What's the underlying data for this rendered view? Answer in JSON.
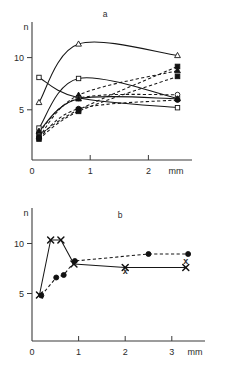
{
  "figure": {
    "background": "#ffffff",
    "ink_color": "#161616"
  },
  "chart_data": [
    {
      "panel_id": "a",
      "panel_label": "a",
      "type": "line",
      "title": "",
      "xlabel": "mm",
      "ylabel": "n",
      "xlim": [
        0,
        2.75
      ],
      "ylim": [
        0,
        12.2
      ],
      "xticks": [
        0,
        1,
        2
      ],
      "xtick_labels": [
        "0",
        "1",
        "2"
      ],
      "yticks": [
        5,
        10
      ],
      "ytick_labels": [
        "5",
        "10"
      ],
      "grid": false,
      "legend": "none",
      "series": [
        {
          "name": "open-triangle-up-rising",
          "marker": "triangle-up-open",
          "line": "solid",
          "x": [
            0.12,
            0.8,
            2.5
          ],
          "y": [
            5.7,
            11.3,
            10.2
          ]
        },
        {
          "name": "open-square-declining",
          "marker": "square-open",
          "line": "solid",
          "x": [
            0.12,
            0.8,
            2.5
          ],
          "y": [
            8.1,
            6.15,
            5.2
          ]
        },
        {
          "name": "open-square-rising",
          "marker": "square-open",
          "line": "solid",
          "x": [
            0.12,
            0.8,
            2.5
          ],
          "y": [
            3.25,
            8.0,
            6.1
          ]
        },
        {
          "name": "filled-square-dashed-upper",
          "marker": "square-filled",
          "line": "dashed",
          "x": [
            0.12,
            0.8,
            2.5
          ],
          "y": [
            2.55,
            5.0,
            9.15
          ]
        },
        {
          "name": "filled-triangle-dashed",
          "marker": "triangle-up-filled",
          "line": "dashed",
          "x": [
            0.12,
            0.8,
            2.5
          ],
          "y": [
            2.4,
            6.4,
            8.75
          ]
        },
        {
          "name": "filled-square-dashed-lower",
          "marker": "square-filled",
          "line": "dashed",
          "x": [
            0.12,
            0.8,
            2.5
          ],
          "y": [
            2.2,
            4.85,
            8.2
          ]
        },
        {
          "name": "open-circle-dashed",
          "marker": "circle-open",
          "line": "dashed",
          "x": [
            0.12,
            0.8,
            2.5
          ],
          "y": [
            2.85,
            6.1,
            6.45
          ]
        },
        {
          "name": "filled-circle-dashed",
          "marker": "circle-filled",
          "line": "dashed",
          "x": [
            0.12,
            0.8,
            2.5
          ],
          "y": [
            2.3,
            5.1,
            5.95
          ]
        },
        {
          "name": "filled-triangle-solid-flat",
          "marker": "triangle-up-filled",
          "line": "solid",
          "x": [
            0.12,
            0.8,
            2.5
          ],
          "y": [
            2.95,
            6.05,
            6.05
          ]
        }
      ]
    },
    {
      "panel_id": "b",
      "panel_label": "b",
      "type": "line",
      "title": "",
      "xlabel": "mm",
      "ylabel": "n",
      "xlim": [
        0,
        3.7
      ],
      "ylim": [
        0,
        12.6
      ],
      "xticks": [
        0,
        1,
        2,
        3
      ],
      "xtick_labels": [
        "0",
        "1",
        "2",
        "3"
      ],
      "yticks": [
        5,
        10
      ],
      "ytick_labels": [
        "5",
        "10"
      ],
      "grid": false,
      "legend": "none",
      "series": [
        {
          "name": "x-marker-solid",
          "marker": "x",
          "line": "solid",
          "x": [
            0.16,
            0.4,
            0.62,
            0.9,
            2.0,
            3.3
          ],
          "y": [
            4.85,
            10.35,
            10.35,
            7.95,
            7.6,
            7.6
          ]
        },
        {
          "name": "filled-circle-dashed",
          "marker": "circle-filled",
          "line": "dashed",
          "x": [
            0.2,
            0.52,
            0.68,
            0.92,
            2.5,
            3.35
          ],
          "y": [
            4.8,
            6.6,
            6.85,
            8.25,
            8.95,
            8.95
          ]
        }
      ],
      "annotations": [
        {
          "text": "x",
          "x": 2.0,
          "y": 7.0,
          "name": "x-annotation-mid"
        },
        {
          "text": "x",
          "x": 3.3,
          "y": 8.0,
          "name": "x-annotation-right"
        }
      ]
    }
  ],
  "panel_a": {
    "label": "a",
    "y_axis_name": "n",
    "x_axis_name": "mm",
    "ytick_labels": [
      "10",
      "5"
    ],
    "xtick_labels": [
      "0",
      "1",
      "2"
    ]
  },
  "panel_b": {
    "label": "b",
    "y_axis_name": "n",
    "x_axis_name": "mm",
    "ytick_labels": [
      "10",
      "5"
    ],
    "xtick_labels": [
      "0",
      "1",
      "2",
      "3"
    ]
  }
}
